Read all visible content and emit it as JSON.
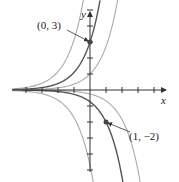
{
  "figure": {
    "axes": {
      "x_label": "x",
      "y_label": "y",
      "origin_px": [
        90,
        90
      ],
      "unit_px": 16,
      "x_ticks": [
        -4,
        -3,
        -2,
        -1,
        1,
        2,
        3,
        4
      ],
      "y_ticks": [
        -5,
        -4,
        -3,
        -2,
        -1,
        1,
        2,
        3,
        4,
        5
      ]
    },
    "family": "y = C e^x",
    "curves": [
      {
        "C": 8.5,
        "color": "#aaaaaa",
        "highlight": false
      },
      {
        "C": 3,
        "color": "#555555",
        "highlight": true
      },
      {
        "C": 1,
        "color": "#aaaaaa",
        "highlight": false
      },
      {
        "C": -0.25,
        "color": "#aaaaaa",
        "highlight": false
      },
      {
        "C": -0.736,
        "color": "#555555",
        "highlight": true
      },
      {
        "C": -4.7,
        "color": "#aaaaaa",
        "highlight": false
      }
    ],
    "points": [
      {
        "label": "(0, 3)",
        "x": 0,
        "y": 3
      },
      {
        "label": "(1, −2)",
        "x": 1,
        "y": -2
      }
    ]
  }
}
